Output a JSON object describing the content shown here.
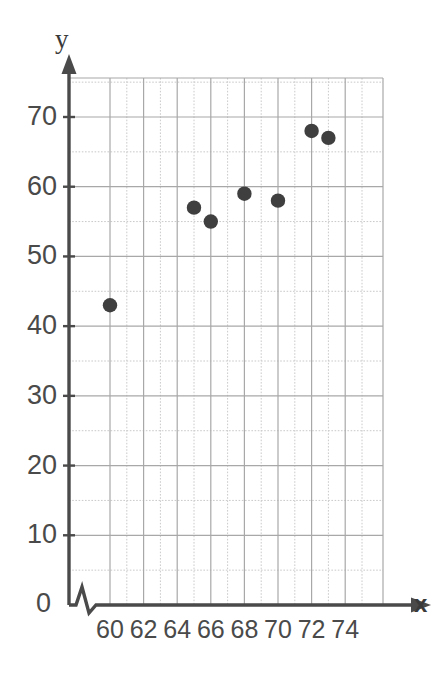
{
  "chart_data": {
    "type": "scatter",
    "title": "",
    "xlabel": "x",
    "ylabel": "y",
    "xlim": [
      59,
      75
    ],
    "ylim": [
      0,
      75
    ],
    "x_axis_break": true,
    "grid": true,
    "grid_major_x_step": 2,
    "grid_major_y_step": 10,
    "grid_minor_y_step": 5,
    "x_ticks": [
      "60",
      "62",
      "64",
      "66",
      "68",
      "70",
      "72",
      "74"
    ],
    "x_tick_values": [
      60,
      62,
      64,
      66,
      68,
      70,
      72,
      74
    ],
    "y_ticks": [
      "0",
      "10",
      "20",
      "30",
      "40",
      "50",
      "60",
      "70"
    ],
    "y_tick_values": [
      0,
      10,
      20,
      30,
      40,
      50,
      60,
      70
    ],
    "origin_label": "0",
    "point_color": "#3f3f3f",
    "grid_color": "#b9b9b9",
    "axis_color": "#4a4a4a",
    "points": [
      {
        "x": 60,
        "y": 43
      },
      {
        "x": 65,
        "y": 57
      },
      {
        "x": 66,
        "y": 55
      },
      {
        "x": 68,
        "y": 59
      },
      {
        "x": 70,
        "y": 58
      },
      {
        "x": 72,
        "y": 68
      },
      {
        "x": 73,
        "y": 67
      }
    ]
  },
  "axes": {
    "y_title": "y",
    "x_title": "x"
  }
}
